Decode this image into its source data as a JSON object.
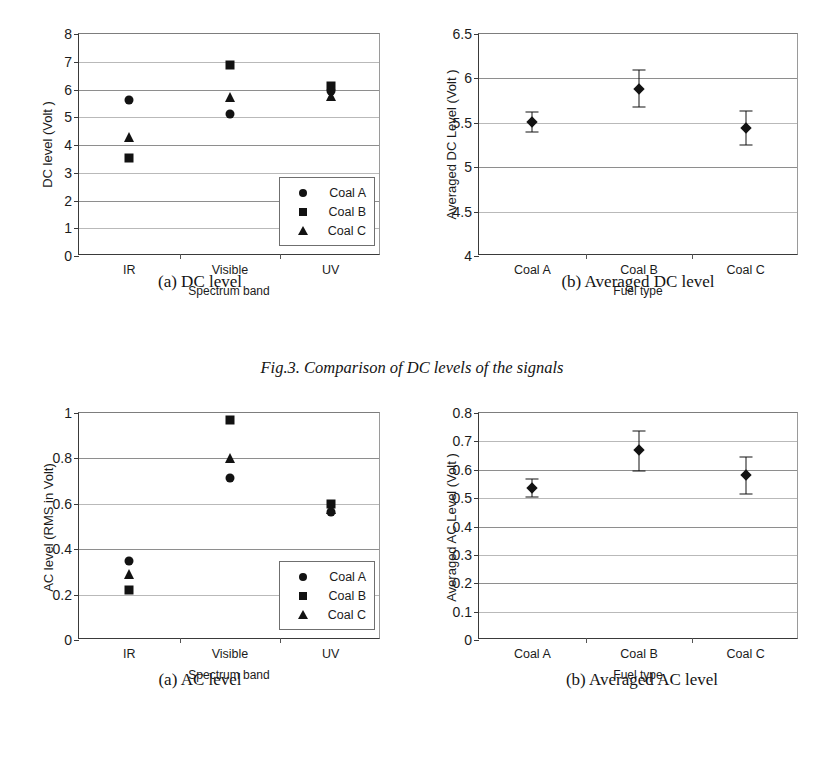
{
  "figure": {
    "caption": "Fig.3. Comparison of DC levels of the signals"
  },
  "panels": {
    "dc_scatter": {
      "subcaption": "(a) DC level",
      "xlabel": "Spectrum band",
      "ylabel": "DC level  (Volt )"
    },
    "dc_averaged": {
      "subcaption": "(b) Averaged DC level",
      "xlabel": "Fuel type",
      "ylabel": "Averaged DC Level  (Volt )"
    },
    "ac_scatter": {
      "subcaption": "(a) AC level",
      "xlabel": "Spectrum band",
      "ylabel": "AC level (RMS in Volt)"
    },
    "ac_averaged": {
      "subcaption": "(b) Averaged AC level",
      "xlabel": "Fuel type",
      "ylabel": "Averaged AC Level  (Volt )"
    }
  },
  "legend": {
    "entries": [
      {
        "label": "Coal A",
        "symbol": "circle"
      },
      {
        "label": "Coal B",
        "symbol": "square"
      },
      {
        "label": "Coal C",
        "symbol": "triangle"
      }
    ]
  },
  "chart_data": [
    {
      "id": "dc_scatter",
      "type": "scatter",
      "title": "(a) DC level",
      "xlabel": "Spectrum band",
      "ylabel": "DC level  (Volt )",
      "categories": [
        "IR",
        "Visible",
        "UV"
      ],
      "ylim": [
        0,
        8
      ],
      "yticks": [
        0,
        1,
        2,
        3,
        4,
        5,
        6,
        7,
        8
      ],
      "ytick_labels": [
        "0",
        "1",
        "2",
        "3",
        "4",
        "5",
        "6",
        "7",
        "8"
      ],
      "grid": true,
      "legend_position": "lower-right",
      "series": [
        {
          "name": "Coal A",
          "symbol": "circle",
          "values": [
            5.62,
            5.12,
            5.95
          ]
        },
        {
          "name": "Coal B",
          "symbol": "square",
          "values": [
            3.52,
            6.9,
            6.12
          ]
        },
        {
          "name": "Coal C",
          "symbol": "triangle",
          "values": [
            4.3,
            5.72,
            5.78
          ]
        }
      ]
    },
    {
      "id": "dc_averaged",
      "type": "scatter",
      "title": "(b) Averaged DC level",
      "xlabel": "Fuel type",
      "ylabel": "Averaged DC Level  (Volt )",
      "categories": [
        "Coal A",
        "Coal B",
        "Coal C"
      ],
      "ylim": [
        4,
        6.5
      ],
      "yticks": [
        4,
        4.5,
        5,
        5.5,
        6,
        6.5
      ],
      "ytick_labels": [
        "4",
        "4.5",
        "5",
        "5.5",
        "6",
        "6.5"
      ],
      "grid": true,
      "legend_position": "none",
      "series": [
        {
          "name": "Averaged DC Level",
          "symbol": "diamond",
          "values": [
            5.51,
            5.88,
            5.44
          ],
          "error_upper": [
            5.62,
            6.09,
            5.63
          ],
          "error_lower": [
            5.4,
            5.68,
            5.25
          ]
        }
      ]
    },
    {
      "id": "ac_scatter",
      "type": "scatter",
      "title": "(a) AC level",
      "xlabel": "Spectrum band",
      "ylabel": "AC level (RMS in Volt)",
      "categories": [
        "IR",
        "Visible",
        "UV"
      ],
      "ylim": [
        0,
        1
      ],
      "yticks": [
        0,
        0.2,
        0.4,
        0.6,
        0.8,
        1
      ],
      "ytick_labels": [
        "0",
        "0.2",
        "0.4",
        "0.6",
        "0.8",
        "1"
      ],
      "grid": true,
      "legend_position": "lower-right",
      "series": [
        {
          "name": "Coal A",
          "symbol": "circle",
          "values": [
            0.35,
            0.715,
            0.565
          ]
        },
        {
          "name": "Coal B",
          "symbol": "square",
          "values": [
            0.22,
            0.97,
            0.6
          ]
        },
        {
          "name": "Coal C",
          "symbol": "triangle",
          "values": [
            0.29,
            0.8,
            0.575
          ]
        }
      ]
    },
    {
      "id": "ac_averaged",
      "type": "scatter",
      "title": "(b) Averaged AC level",
      "xlabel": "Fuel type",
      "ylabel": "Averaged AC Level  (Volt )",
      "categories": [
        "Coal A",
        "Coal B",
        "Coal C"
      ],
      "ylim": [
        0,
        0.8
      ],
      "yticks": [
        0,
        0.1,
        0.2,
        0.3,
        0.4,
        0.5,
        0.6,
        0.7,
        0.8
      ],
      "ytick_labels": [
        "0",
        "0.1",
        "0.2",
        "0.3",
        "0.4",
        "0.5",
        "0.6",
        "0.7",
        "0.8"
      ],
      "grid": true,
      "legend_position": "none",
      "series": [
        {
          "name": "Averaged AC Level",
          "symbol": "diamond",
          "values": [
            0.535,
            0.67,
            0.58
          ],
          "error_upper": [
            0.568,
            0.735,
            0.645
          ],
          "error_lower": [
            0.503,
            0.594,
            0.516
          ]
        }
      ]
    }
  ]
}
